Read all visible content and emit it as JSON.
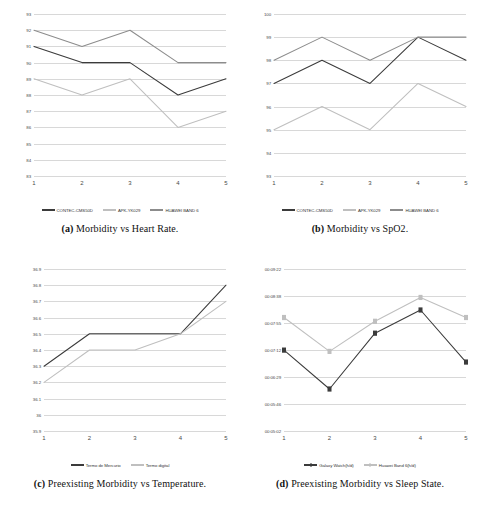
{
  "figure": {
    "panels": [
      {
        "key": "a",
        "caption_tag": "(a)",
        "caption_text": " Morbidity vs Heart Rate.",
        "chart_data": {
          "type": "line",
          "title": "Morbidity vs Heart Rate",
          "xlabel": "",
          "ylabel": "",
          "categories": [
            "1",
            "2",
            "3",
            "4",
            "5"
          ],
          "ylim": [
            83,
            93
          ],
          "ytick_step": 1,
          "yticks": [
            "83",
            "84",
            "85",
            "86",
            "87",
            "88",
            "89",
            "90",
            "91",
            "92",
            "93"
          ],
          "grid": true,
          "legend_position": "bottom",
          "series": [
            {
              "name": "CONTEC-CMS50D",
              "color": "#3b3b3b",
              "values": [
                91,
                90,
                90,
                88,
                89
              ]
            },
            {
              "name": "APK-YK029",
              "color": "#bfbfbf",
              "values": [
                89,
                88,
                89,
                86,
                87
              ]
            },
            {
              "name": "HUAWEI BAND 6",
              "color": "#8c8c8c",
              "values": [
                92,
                91,
                92,
                90,
                90
              ]
            }
          ]
        }
      },
      {
        "key": "b",
        "caption_tag": "(b)",
        "caption_text": " Morbidity vs SpO2.",
        "chart_data": {
          "type": "line",
          "title": "Morbidity vs SpO2",
          "xlabel": "",
          "ylabel": "",
          "categories": [
            "1",
            "2",
            "3",
            "4",
            "5"
          ],
          "ylim": [
            93,
            100
          ],
          "ytick_step": 1,
          "yticks": [
            "93",
            "94",
            "95",
            "96",
            "97",
            "98",
            "99",
            "100"
          ],
          "grid": true,
          "legend_position": "bottom",
          "series": [
            {
              "name": "CONTEC-CMS50D",
              "color": "#3b3b3b",
              "values": [
                97,
                98,
                97,
                99,
                98
              ]
            },
            {
              "name": "APK-YK029",
              "color": "#bfbfbf",
              "values": [
                95,
                96,
                95,
                97,
                96
              ]
            },
            {
              "name": "HUAWEI BAND 6",
              "color": "#8c8c8c",
              "values": [
                98,
                99,
                98,
                99,
                99
              ]
            }
          ]
        }
      },
      {
        "key": "c",
        "caption_tag": "(c)",
        "caption_text": " Preexisting Morbidity vs Temperature.",
        "chart_data": {
          "type": "line",
          "title": "Preexisting Morbidity vs Temperature",
          "xlabel": "",
          "ylabel": "",
          "categories": [
            "1",
            "2",
            "3",
            "4",
            "5"
          ],
          "ylim": [
            35.9,
            36.9
          ],
          "ytick_step": 0.1,
          "yticks": [
            "35.9",
            "36",
            "36.1",
            "36.2",
            "36.3",
            "36.4",
            "36.5",
            "36.6",
            "36.7",
            "36.8",
            "36.9"
          ],
          "grid": true,
          "legend_position": "bottom",
          "series": [
            {
              "name": "Termo de Mercurio",
              "color": "#3b3b3b",
              "values": [
                36.3,
                36.5,
                36.5,
                36.5,
                36.8
              ]
            },
            {
              "name": "Termo digital",
              "color": "#bfbfbf",
              "values": [
                36.2,
                36.4,
                36.4,
                36.5,
                36.7
              ]
            }
          ]
        }
      },
      {
        "key": "d",
        "caption_tag": "(d)",
        "caption_text": " Preexisting Morbidity vs Sleep State.",
        "chart_data": {
          "type": "line",
          "title": "Preexisting Morbidity vs Sleep State",
          "xlabel": "",
          "ylabel": "",
          "categories": [
            "1",
            "2",
            "3",
            "4",
            "5"
          ],
          "ylim": [
            18302,
            33802
          ],
          "ytick_step": 2583,
          "yticks": [
            "00:05:02",
            "00:05:46",
            "00:06:29",
            "00:07:12",
            "00:07:55",
            "00:08:38",
            "00:09:22"
          ],
          "grid": true,
          "markers": "square",
          "legend_position": "bottom",
          "series": [
            {
              "name": "Galaxy Watch(h/d)",
              "color": "#3b3b3b",
              "value_labels": [
                "00:07:14",
                "00:06:12",
                "00:07:41",
                "00:08:18",
                "00:06:55"
              ],
              "values": [
                26040,
                22320,
                27660,
                29880,
                24900
              ]
            },
            {
              "name": "Huawei Band 6(h/d)",
              "color": "#bfbfbf",
              "value_labels": [
                "00:08:06",
                "00:07:12",
                "00:08:00",
                "00:08:38",
                "00:08:06"
              ],
              "values": [
                29160,
                25920,
                28800,
                31080,
                29160
              ]
            }
          ]
        }
      }
    ]
  }
}
